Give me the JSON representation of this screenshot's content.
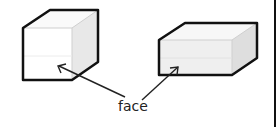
{
  "diagram": {
    "label": "face",
    "shapes": [
      {
        "name": "cube",
        "front_face_color": "#ffffff",
        "side_color": "#e6e6e6"
      },
      {
        "name": "cuboid",
        "front_face_color": "#f0f0f0",
        "side_color": "#dcdcdc"
      }
    ],
    "colors": {
      "outline": "#111111",
      "arrow": "#222222",
      "border": "#111111"
    }
  }
}
